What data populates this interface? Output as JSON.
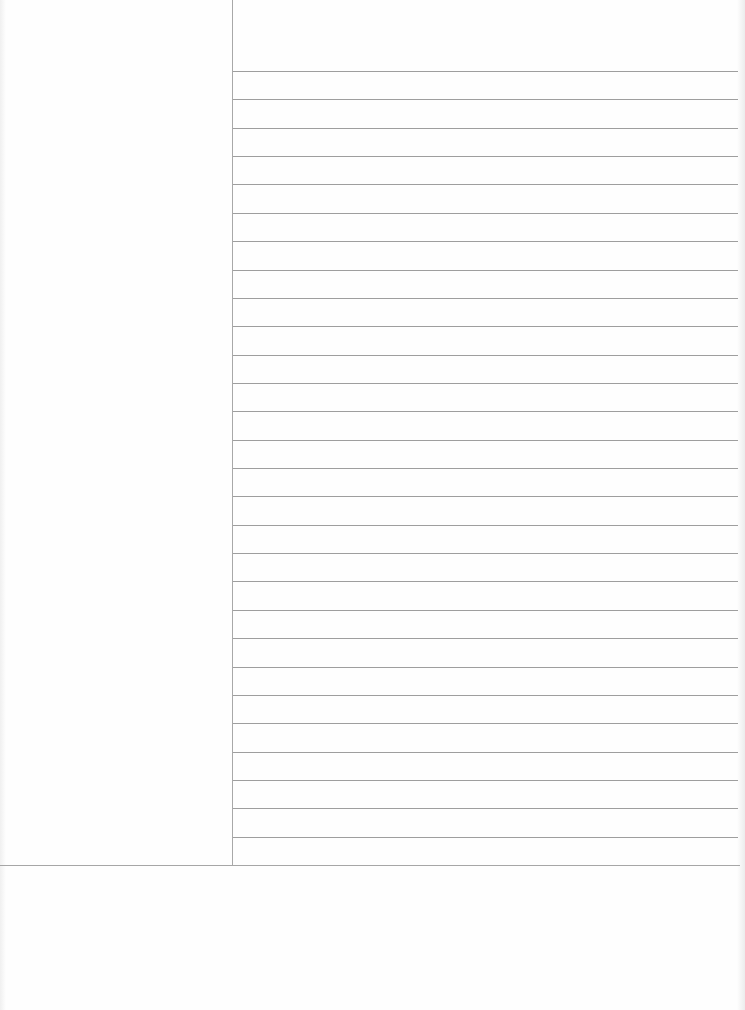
{
  "document": {
    "type": "cornell-notes-sheet",
    "title": "",
    "cue_column": {
      "text": ""
    },
    "header_area": {
      "text": ""
    },
    "notes_area": {
      "line_count": 29,
      "first_line_y": 71,
      "line_spacing": 28.36,
      "lines": []
    },
    "summary_area": {
      "text": ""
    }
  },
  "colors": {
    "paper": "#fefefe",
    "rule": "#9e9e9e",
    "cue_rule": "#a8a8a8"
  }
}
